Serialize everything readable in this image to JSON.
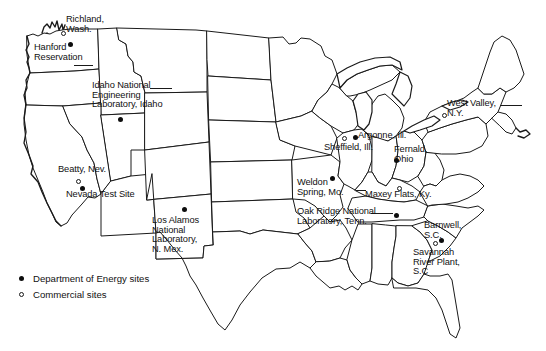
{
  "figure": {
    "background_color": "#ffffff",
    "line_color": "#1a1a1a"
  },
  "legend": {
    "items": [
      {
        "marker": "filled-dot",
        "label": "Department of Energy sites"
      },
      {
        "marker": "open-circle",
        "label": "Commercial sites"
      }
    ]
  },
  "sites": [
    {
      "id": "richland",
      "label": "Richland,\nWash.",
      "type": "commercial",
      "marker_x": 61,
      "marker_y": 31,
      "label_x": 66,
      "label_y": 15,
      "align": "left"
    },
    {
      "id": "hanford",
      "label": "Hanford\nReservation",
      "type": "doe",
      "marker_x": 68,
      "marker_y": 42,
      "label_x": 34,
      "label_y": 43,
      "align": "left"
    },
    {
      "id": "ine-lab",
      "label": "Idaho National\nEngineering\nLaboratory, Idaho",
      "type": "doe",
      "marker_x": 118,
      "marker_y": 117,
      "label_x": 92,
      "label_y": 81,
      "align": "left"
    },
    {
      "id": "beatty",
      "label": "Beatty, Nev.",
      "type": "commercial",
      "marker_x": 76,
      "marker_y": 179,
      "label_x": 58,
      "label_y": 165,
      "align": "left"
    },
    {
      "id": "nts",
      "label": "Nevada Test Site",
      "type": "doe",
      "marker_x": 80,
      "marker_y": 186,
      "label_x": 66,
      "label_y": 190,
      "align": "left"
    },
    {
      "id": "los-alamos",
      "label": "Los Alamos\nNational\nLaboratory,\nN. Mex.",
      "type": "doe",
      "marker_x": 182,
      "marker_y": 207,
      "label_x": 152,
      "label_y": 216,
      "align": "left"
    },
    {
      "id": "argonne",
      "label": "Argonne, Ill.",
      "type": "doe",
      "marker_x": 353,
      "marker_y": 135,
      "label_x": 358,
      "label_y": 131,
      "align": "left"
    },
    {
      "id": "sheffield",
      "label": "Sheffield, Ill.",
      "type": "commercial",
      "marker_x": 342,
      "marker_y": 136,
      "label_x": 324,
      "label_y": 143,
      "align": "left"
    },
    {
      "id": "fernald",
      "label": "Fernald,\nOhio",
      "type": "doe",
      "marker_x": 394,
      "marker_y": 158,
      "label_x": 394,
      "label_y": 145,
      "align": "left"
    },
    {
      "id": "west-valley",
      "label": "West Valley,\nN.Y.",
      "type": "commercial",
      "marker_x": 442,
      "marker_y": 113,
      "label_x": 447,
      "label_y": 99,
      "align": "left"
    },
    {
      "id": "weldon",
      "label": "Weldon\nSpring, Mo.",
      "type": "doe",
      "marker_x": 330,
      "marker_y": 176,
      "label_x": 297,
      "label_y": 178,
      "align": "left"
    },
    {
      "id": "maxey",
      "label": "Maxey Flats, Ky.",
      "type": "commercial",
      "marker_x": 397,
      "marker_y": 186,
      "label_x": 365,
      "label_y": 190,
      "align": "left"
    },
    {
      "id": "oak-ridge",
      "label": "Oak Ridge National\nLaboratory, Tenn.",
      "type": "doe",
      "marker_x": 394,
      "marker_y": 213,
      "label_x": 297,
      "label_y": 207,
      "align": "left"
    },
    {
      "id": "barnwell",
      "label": "Barnwell,\nS.C.",
      "type": "commercial",
      "marker_x": 433,
      "marker_y": 241,
      "label_x": 424,
      "label_y": 221,
      "align": "left"
    },
    {
      "id": "savannah",
      "label": "Savannah\nRiver Plant,\nS.C",
      "type": "doe",
      "marker_x": 439,
      "marker_y": 238,
      "label_x": 413,
      "label_y": 248,
      "align": "left"
    }
  ],
  "leaders": [
    {
      "id": "hanford-leader",
      "x": 74,
      "y": 65,
      "w": 19,
      "h": 1
    },
    {
      "id": "idaho-leader",
      "x": 150,
      "y": 88,
      "w": 22,
      "h": 1
    },
    {
      "id": "oakridge-leader",
      "x": 371,
      "y": 213,
      "w": 22,
      "h": 1
    },
    {
      "id": "maxey-leader",
      "x": 356,
      "y": 190,
      "w": 10,
      "h": 1
    },
    {
      "id": "westvalley-leader",
      "x": 500,
      "y": 105,
      "w": 22,
      "h": 1
    }
  ],
  "caption": {
    "partial_text": ""
  }
}
